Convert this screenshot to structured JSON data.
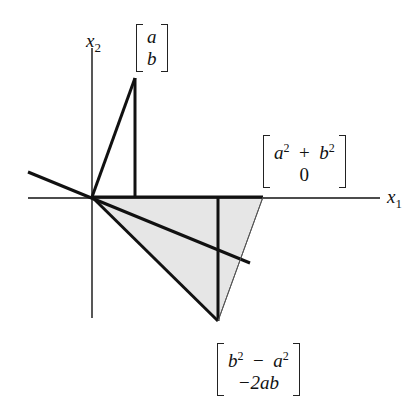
{
  "diagram": {
    "axes": {
      "x_label": "x",
      "x_sub": "1",
      "y_label": "x",
      "y_sub": "2"
    },
    "vectors": {
      "v_ab": {
        "top": "a",
        "bottom": "b"
      },
      "v_sum": {
        "top_a": "a",
        "top_b": "b",
        "plus": "+",
        "bottom": "0"
      },
      "v_reflect": {
        "top_b": "b",
        "minus": "−",
        "top_a": "a",
        "bottom": "−2ab"
      }
    },
    "colors": {
      "fill": "#e6e6e6",
      "stroke": "#111111"
    },
    "geometry": {
      "origin": [
        92,
        197
      ],
      "point_ab": [
        135,
        78
      ],
      "point_sum": [
        263,
        197
      ],
      "point_reflect": [
        218,
        321
      ],
      "mirror_line": [
        [
          28,
          172
        ],
        [
          250,
          263
        ]
      ]
    }
  }
}
